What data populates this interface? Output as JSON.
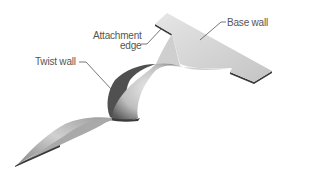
{
  "diagram": {
    "labels": {
      "base_wall": "Base wall",
      "attachment_edge_line1": "Attachment",
      "attachment_edge_line2": "edge",
      "twist_wall": "Twist wall"
    },
    "colors": {
      "background": "#ffffff",
      "surface_light": "#d9d9d9",
      "surface_mid": "#b5b5b5",
      "surface_dark": "#4a4a4a",
      "leader_line": "#555555",
      "text": "#555555"
    }
  }
}
